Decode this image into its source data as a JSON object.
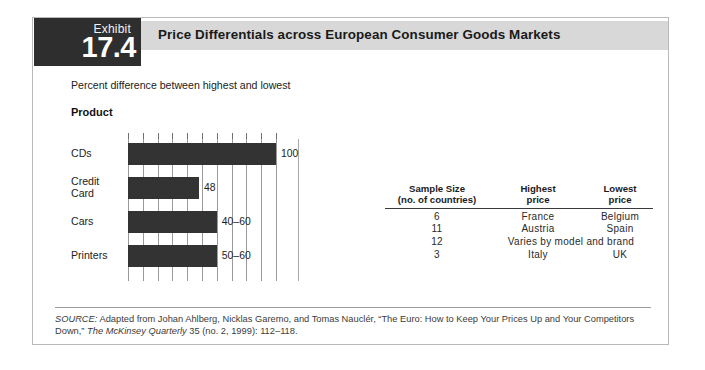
{
  "exhibit": {
    "label": "Exhibit",
    "number": "17.4",
    "title": "Price Differentials across European Consumer Goods Markets",
    "subtitle": "Percent difference between highest and lowest",
    "axis_group_label": "Product"
  },
  "chart_data": {
    "type": "bar",
    "orientation": "horizontal",
    "title": "Price Differentials across European Consumer Goods Markets",
    "subtitle": "Percent difference between highest and lowest",
    "xlabel": "",
    "ylabel": "Product",
    "categories": [
      "CDs",
      "Credit\nCard",
      "Cars",
      "Printers"
    ],
    "values": [
      100,
      48,
      60,
      60
    ],
    "value_labels": [
      "100",
      "48",
      "40–60",
      "50–60"
    ],
    "xlim": [
      0,
      100
    ],
    "xticks": [
      0,
      10,
      20,
      30,
      40,
      50,
      60,
      70,
      80,
      90,
      100
    ],
    "extra_gridline": 115,
    "grid": true,
    "legend": "none",
    "bar_color": "#333333"
  },
  "table": {
    "headers": [
      {
        "line1": "Sample Size",
        "line2": "(no. of countries)"
      },
      {
        "line1": "Highest",
        "line2": "price"
      },
      {
        "line1": "Lowest",
        "line2": "price"
      }
    ],
    "rows": [
      {
        "sample": "6",
        "highest": "France",
        "lowest": "Belgium",
        "merged": false
      },
      {
        "sample": "11",
        "highest": "Austria",
        "lowest": "Spain",
        "merged": false
      },
      {
        "sample": "12",
        "highest": "Varies by model and brand",
        "lowest": "",
        "merged": true
      },
      {
        "sample": "3",
        "highest": "Italy",
        "lowest": "UK",
        "merged": false
      }
    ]
  },
  "source": {
    "label": "SOURCE:",
    "text": " Adapted from Johan Ahlberg, Nicklas Garemo, and Tomas Nauclér, “The Euro: How to Keep Your Prices Up and Your Competitors Down,” ",
    "italic_title": "The McKinsey Quarterly",
    "tail": " 35 (no. 2, 1999): 112–118."
  }
}
